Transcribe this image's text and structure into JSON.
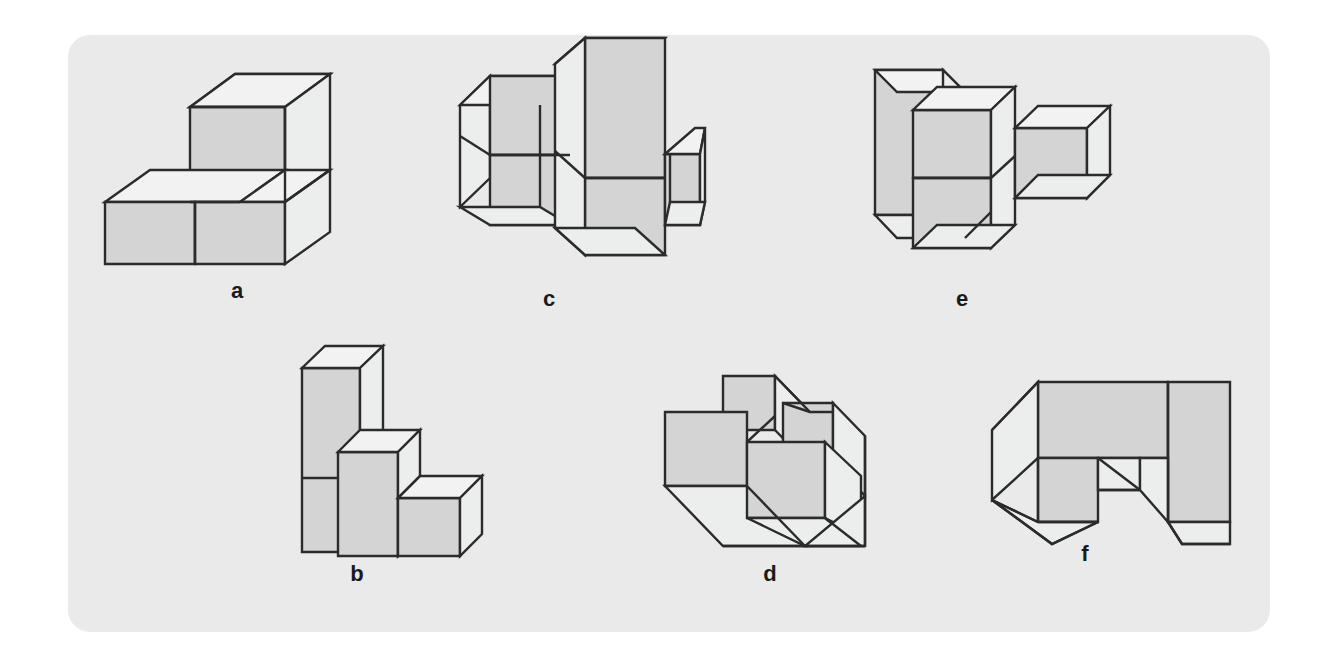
{
  "page": {
    "background_color": "#ffffff",
    "panel_color": "#eaeaea",
    "outline_color": "#2b2b2b",
    "shaded_face_color": "#d4d4d4",
    "light_face_color": "#eceded"
  },
  "figures": [
    {
      "id": "a",
      "label": "a",
      "description": "Stepped block of cubes: an L-shaped solid, two cubes wide and two deep, with one cube raised on the rear-left forming a step",
      "label_x": 237,
      "label_y": 288,
      "origin_x": 95,
      "origin_y": 82
    },
    {
      "id": "c",
      "label": "c",
      "description": "Cross-shaped arrangement: a tall vertical slab of two cubes crossing a horizontal row of cubes, with a cube projecting to the right",
      "label_x": 549,
      "label_y": 288,
      "origin_x": 455,
      "origin_y": 50
    },
    {
      "id": "e",
      "label": "e",
      "description": "Tall vertical slab at left with a two-cube column in front of it and a single cube projecting to the right",
      "label_x": 962,
      "label_y": 288,
      "origin_x": 865,
      "origin_y": 50
    },
    {
      "id": "b",
      "label": "b",
      "description": "Descending staircase of three steps: a tall three-cube column, a two-cube column, then a single cube at the right",
      "label_x": 357,
      "label_y": 563,
      "origin_x": 280,
      "origin_y": 330
    },
    {
      "id": "d",
      "label": "d",
      "description": "U-shaped or channel block seen from above: raised walls at the left, rear and right with a recessed interior",
      "label_x": 770,
      "label_y": 563,
      "origin_x": 665,
      "origin_y": 368
    },
    {
      "id": "f",
      "label": "f",
      "description": "Wide block with a notch cut out of the front centre, leaving two legs and a bridging slab above",
      "label_x": 1085,
      "label_y": 563,
      "origin_x": 980,
      "origin_y": 372
    }
  ]
}
